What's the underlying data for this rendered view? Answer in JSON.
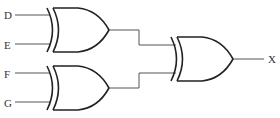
{
  "diagram": {
    "type": "logic-circuit",
    "inputs": [
      {
        "label": "D",
        "y": 15
      },
      {
        "label": "E",
        "y": 45
      },
      {
        "label": "F",
        "y": 74
      },
      {
        "label": "G",
        "y": 103
      }
    ],
    "gates": [
      {
        "id": "g1",
        "type": "XOR",
        "inputs": [
          "D",
          "E"
        ]
      },
      {
        "id": "g2",
        "type": "XOR",
        "inputs": [
          "F",
          "G"
        ]
      },
      {
        "id": "g3",
        "type": "XOR",
        "inputs": [
          "g1",
          "g2"
        ],
        "output": "X"
      }
    ],
    "output": {
      "label": "X"
    }
  }
}
